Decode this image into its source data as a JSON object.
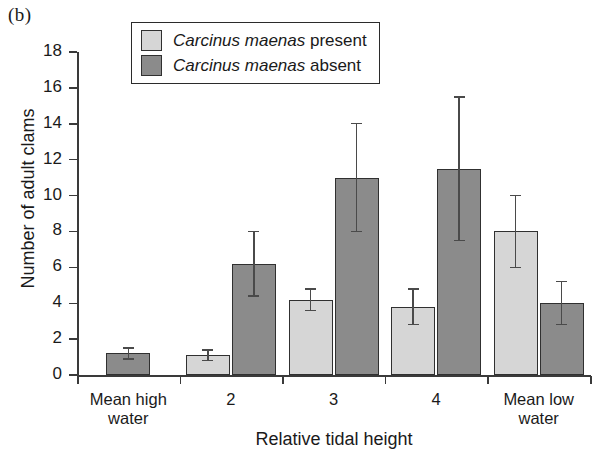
{
  "panel_label": "(b)",
  "legend": {
    "position": "top-center",
    "entries": [
      {
        "species": "Carcinus maenas",
        "qualifier": " present",
        "swatch": "light",
        "color": "#d6d6d6"
      },
      {
        "species": "Carcinus maenas",
        "qualifier": " absent",
        "swatch": "dark",
        "color": "#8b8b8b"
      }
    ]
  },
  "chart_data": {
    "type": "bar",
    "title": "",
    "xlabel": "Relative tidal height",
    "ylabel": "Number of adult clams",
    "categories": [
      "Mean high water",
      "2",
      "3",
      "4",
      "Mean low water"
    ],
    "category_lines": [
      [
        "Mean high",
        "water"
      ],
      [
        "2"
      ],
      [
        "3"
      ],
      [
        "4"
      ],
      [
        "Mean low",
        "water"
      ]
    ],
    "ylim": [
      0,
      18
    ],
    "yticks": [
      0,
      2,
      4,
      6,
      8,
      10,
      12,
      14,
      16,
      18
    ],
    "ytick_labels": [
      "0",
      "2",
      "4",
      "6",
      "8",
      "10",
      "12",
      "14",
      "16",
      "18"
    ],
    "grid": false,
    "legend_position": "top-center",
    "series": [
      {
        "name": "Carcinus maenas present",
        "color": "#d6d6d6",
        "values": [
          null,
          1.1,
          4.2,
          3.8,
          8.0
        ],
        "errors": [
          null,
          0.3,
          0.6,
          1.0,
          2.0
        ]
      },
      {
        "name": "Carcinus maenas absent",
        "color": "#8b8b8b",
        "values": [
          1.2,
          6.2,
          11.0,
          11.5,
          4.0
        ],
        "errors": [
          0.3,
          1.8,
          3.0,
          4.0,
          1.2
        ]
      }
    ]
  }
}
